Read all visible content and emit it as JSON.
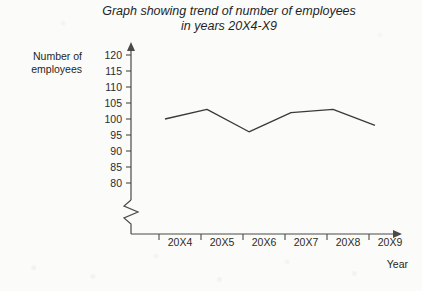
{
  "chart_data": {
    "type": "line",
    "title": "Graph showing trend of number of employees in years 20X4-X9",
    "title_line1": "Graph showing trend of number of employees",
    "title_line2": "in years 20X4-X9",
    "xlabel": "Year",
    "ylabel": "Number of employees",
    "ylabel_line1": "Number of",
    "ylabel_line2": "employees",
    "categories": [
      "20X4",
      "20X5",
      "20X6",
      "20X7",
      "20X8",
      "20X9"
    ],
    "values": [
      100,
      103,
      96,
      102,
      103,
      98
    ],
    "series": [
      {
        "name": "Number of employees",
        "values": [
          100,
          103,
          96,
          102,
          103,
          98
        ]
      }
    ],
    "ylim": [
      78,
      122
    ],
    "yticks": [
      120,
      115,
      110,
      105,
      100,
      95,
      90,
      85,
      80
    ],
    "ytick_labels": [
      "120",
      "115",
      "110",
      "105",
      "100",
      "95",
      "90",
      "85",
      "80"
    ],
    "axis_break": true,
    "axis_break_note": "zigzag break on y-axis below 80",
    "grid": false,
    "legend": false,
    "line_color": "#3a3a3a",
    "axis_color": "#4a4a4a",
    "background_color": "#fbfbf9"
  }
}
